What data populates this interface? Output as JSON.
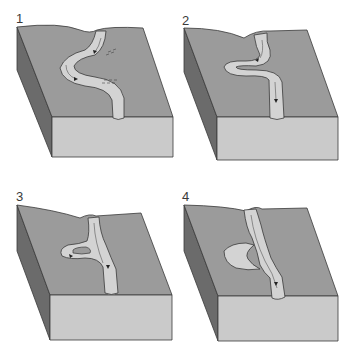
{
  "diagram": {
    "colors": {
      "top_surface": "#9b9b9b",
      "front_face": "#cacaca",
      "side_face": "#6b6b6b",
      "river": "#d3d3d3",
      "outline": "#3a3a3a",
      "arrow": "#222222"
    },
    "panels": [
      {
        "number": "1",
        "stage": "gentle-meander",
        "annotations": [
          "erosion-dashes-upper",
          "erosion-dashes-lower"
        ]
      },
      {
        "number": "2",
        "stage": "pronounced-meander"
      },
      {
        "number": "3",
        "stage": "meander-neck-cutoff"
      },
      {
        "number": "4",
        "stage": "oxbow-lake-formed"
      }
    ]
  }
}
